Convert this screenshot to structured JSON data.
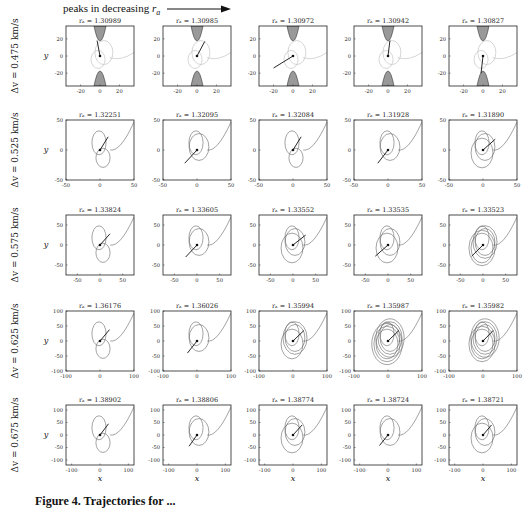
{
  "header": {
    "text": "peaks in decreasing",
    "symbol": "r",
    "subscript": "a"
  },
  "caption": {
    "text": "Figure 4. Trajectories for ..."
  },
  "chart_data": {
    "type": "line",
    "layout": {
      "rows": 5,
      "cols": 5,
      "grid": false
    },
    "xlabel": "x",
    "ylabel": "y",
    "rows": [
      {
        "row_label": "Δv = 0.475 km/s",
        "xlim": [
          -35,
          35
        ],
        "ylim": [
          -35,
          35
        ],
        "xticks": [
          -20,
          0,
          20
        ],
        "yticks": [
          -20,
          0,
          20
        ],
        "has_forbidden_regions": true,
        "panels": [
          {
            "title": "r_a = 1.30989",
            "arrow": [
              [
                0,
                0
              ],
              [
                -3,
                18
              ]
            ]
          },
          {
            "title": "r_a = 1.30985",
            "arrow": [
              [
                0,
                0
              ],
              [
                8,
                17
              ]
            ]
          },
          {
            "title": "r_a = 1.30972",
            "arrow": [
              [
                0,
                0
              ],
              [
                -20,
                -14
              ]
            ]
          },
          {
            "title": "r_a = 1.30942",
            "arrow": [
              [
                0,
                0
              ],
              [
                2,
                18
              ]
            ]
          },
          {
            "title": "r_a = 1.30827",
            "arrow": [
              [
                0,
                0
              ],
              [
                -2,
                -20
              ]
            ]
          }
        ]
      },
      {
        "row_label": "Δv = 0.525 km/s",
        "xlim": [
          -50,
          50
        ],
        "ylim": [
          -50,
          50
        ],
        "xticks": [
          -50,
          0,
          50
        ],
        "yticks": [
          -50,
          0,
          50
        ],
        "panels": [
          {
            "title": "r_a = 1.32251",
            "arrow": [
              [
                0,
                0
              ],
              [
                12,
                22
              ]
            ],
            "loops": 1
          },
          {
            "title": "r_a = 1.32095",
            "arrow": [
              [
                0,
                0
              ],
              [
                -18,
                -22
              ]
            ],
            "loops": 2
          },
          {
            "title": "r_a = 1.32084",
            "arrow": [
              [
                0,
                0
              ],
              [
                12,
                22
              ]
            ],
            "loops": 1
          },
          {
            "title": "r_a = 1.31928",
            "arrow": [
              [
                0,
                0
              ],
              [
                -15,
                -22
              ]
            ],
            "loops": 2
          },
          {
            "title": "r_a = 1.31890",
            "arrow": [
              [
                0,
                0
              ],
              [
                18,
                18
              ]
            ],
            "loops": 3
          }
        ]
      },
      {
        "row_label": "Δv = 0.575 km/s",
        "xlim": [
          -75,
          75
        ],
        "ylim": [
          -75,
          75
        ],
        "xticks": [
          -50,
          0,
          50
        ],
        "yticks": [
          -50,
          0,
          50
        ],
        "panels": [
          {
            "title": "r_a = 1.33824",
            "arrow": [
              [
                0,
                0
              ],
              [
                22,
                28
              ]
            ],
            "loops": 1
          },
          {
            "title": "r_a = 1.33605",
            "arrow": [
              [
                0,
                0
              ],
              [
                -25,
                -30
              ]
            ],
            "loops": 2
          },
          {
            "title": "r_a = 1.33552",
            "arrow": [
              [
                0,
                0
              ],
              [
                28,
                25
              ]
            ],
            "loops": 3
          },
          {
            "title": "r_a = 1.33535",
            "arrow": [
              [
                0,
                0
              ],
              [
                -28,
                -28
              ]
            ],
            "loops": 3
          },
          {
            "title": "r_a = 1.33523",
            "arrow": [
              [
                0,
                0
              ],
              [
                -25,
                -28
              ]
            ],
            "loops": 5
          }
        ]
      },
      {
        "row_label": "Δv = 0.625 km/s",
        "xlim": [
          -100,
          100
        ],
        "ylim": [
          -100,
          100
        ],
        "xticks": [
          -100,
          0,
          100
        ],
        "yticks": [
          -100,
          -50,
          0,
          50,
          100
        ],
        "panels": [
          {
            "title": "r_a = 1.36176",
            "arrow": [
              [
                0,
                0
              ],
              [
                28,
                38
              ]
            ],
            "loops": 1
          },
          {
            "title": "r_a = 1.36026",
            "arrow": [
              [
                0,
                0
              ],
              [
                -28,
                -40
              ]
            ],
            "loops": 2
          },
          {
            "title": "r_a = 1.35994",
            "arrow": [
              [
                0,
                0
              ],
              [
                32,
                35
              ]
            ],
            "loops": 4
          },
          {
            "title": "r_a = 1.35987",
            "arrow": [
              [
                0,
                0
              ],
              [
                32,
                35
              ]
            ],
            "loops": 7
          },
          {
            "title": "r_a = 1.35982",
            "arrow": [
              [
                0,
                0
              ],
              [
                30,
                35
              ]
            ],
            "loops": 6
          }
        ]
      },
      {
        "row_label": "Δv = 0.675 km/s",
        "xlim": [
          -120,
          120
        ],
        "ylim": [
          -120,
          120
        ],
        "xticks": [
          -100,
          0,
          100
        ],
        "yticks": [
          -100,
          -50,
          0,
          50,
          100
        ],
        "panels": [
          {
            "title": "r_a = 1.38902",
            "arrow": [
              [
                0,
                0
              ],
              [
                30,
                45
              ]
            ],
            "loops": 1
          },
          {
            "title": "r_a = 1.38806",
            "arrow": [
              [
                0,
                0
              ],
              [
                -28,
                -45
              ]
            ],
            "loops": 2
          },
          {
            "title": "r_a = 1.38774",
            "arrow": [
              [
                0,
                0
              ],
              [
                32,
                40
              ]
            ],
            "loops": 3
          },
          {
            "title": "r_a = 1.38724",
            "arrow": [
              [
                0,
                0
              ],
              [
                -30,
                -42
              ]
            ],
            "loops": 2
          },
          {
            "title": "r_a = 1.38721",
            "arrow": [
              [
                0,
                0
              ],
              [
                30,
                40
              ]
            ],
            "loops": 3
          }
        ]
      }
    ]
  }
}
